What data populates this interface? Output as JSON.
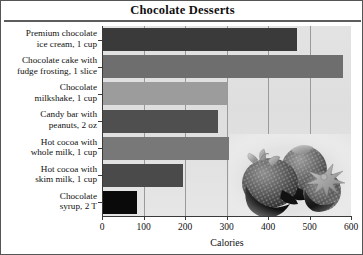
{
  "chart_data": {
    "type": "bar",
    "orientation": "horizontal",
    "title": "Chocolate Desserts",
    "xlabel": "Calories",
    "ylabel": "",
    "xlim": [
      0,
      600
    ],
    "xticks": [
      0,
      100,
      200,
      300,
      400,
      500,
      600
    ],
    "xtick_labels": [
      "0",
      "100",
      "200",
      "300",
      "400",
      "500",
      "600"
    ],
    "grid": "vertical",
    "legend": "none",
    "categories": [
      "Premium chocolate ice cream, 1 cup",
      "Chocolate cake with fudge frosting, 1 slice",
      "Chocolate milkshake, 1 cup",
      "Candy bar with peanuts, 2 oz",
      "Hot cocoa with whole milk, 1 cup",
      "Hot cocoa with skim milk, 1 cup",
      "Chocolate syrup, 2 T"
    ],
    "category_lines": [
      [
        "Premium chocolate",
        "ice cream, 1 cup"
      ],
      [
        "Chocolate cake with",
        "fudge frosting, 1 slice"
      ],
      [
        "Chocolate",
        "milkshake, 1 cup"
      ],
      [
        "Candy bar with",
        "peanuts, 2 oz"
      ],
      [
        "Hot cocoa with",
        "whole milk, 1 cup"
      ],
      [
        "Hot cocoa with",
        "skim milk, 1 cup"
      ],
      [
        "Chocolate",
        "syrup, 2 T"
      ]
    ],
    "values": [
      470,
      580,
      300,
      280,
      310,
      195,
      85
    ],
    "bar_colors": [
      "#3a3a3a",
      "#6e6e6e",
      "#9c9c9c",
      "#4f4f4f",
      "#787878",
      "#4a4a4a",
      "#0a0a0a"
    ]
  },
  "decoration": {
    "photo_name": "chocolate-dipped-strawberries-photo",
    "plot_background": "#e1e1e1",
    "gridline_color": "#9a9a9a",
    "axis_color": "#3a3a3a",
    "title_rule_color": "#5c5c5c",
    "border_color": "#555555"
  }
}
